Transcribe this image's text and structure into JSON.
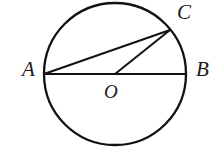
{
  "figure": {
    "kind": "circle-geometry-diagram",
    "canvas": {
      "width": 223,
      "height": 165,
      "background": "#ffffff"
    },
    "stroke_color": "#121212",
    "label_color": "#1a1a1a",
    "circle": {
      "cx": 115,
      "cy": 74,
      "r": 71,
      "stroke_width": 2.3
    },
    "points": {
      "A": {
        "x": 44,
        "y": 74,
        "label": "A",
        "label_x": 22,
        "label_y": 59
      },
      "B": {
        "x": 186,
        "y": 74,
        "label": "B",
        "label_x": 196,
        "label_y": 59
      },
      "C": {
        "x": 170,
        "y": 30,
        "label": "C",
        "label_x": 177,
        "label_y": 2
      },
      "O": {
        "x": 115,
        "y": 74,
        "label": "O",
        "label_x": 104,
        "label_y": 82
      }
    },
    "segments": [
      {
        "name": "chord-AC",
        "from": "A",
        "to": "C",
        "stroke_width": 2.0
      },
      {
        "name": "diameter-AB",
        "from": "A",
        "to": "B",
        "stroke_width": 2.0
      },
      {
        "name": "radius-OC",
        "from": "O",
        "to": "C",
        "stroke_width": 2.0
      }
    ]
  }
}
